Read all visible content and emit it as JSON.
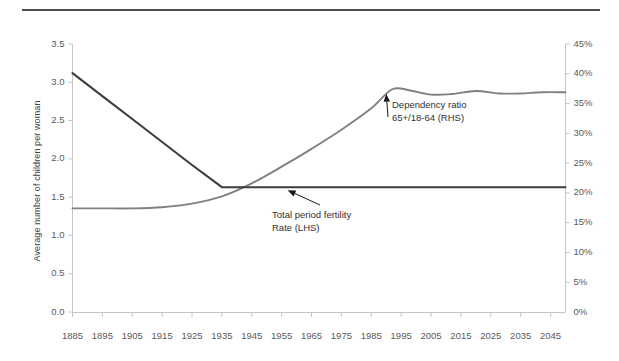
{
  "chart_data": {
    "type": "line",
    "title": "",
    "subtitle": "",
    "xlabel": "",
    "ylabel": "Average  number of children per woman",
    "ylabel_right": "",
    "xlim": [
      1885,
      2050
    ],
    "ylim": [
      0.0,
      3.5
    ],
    "ylim_right": [
      0,
      45
    ],
    "grid": false,
    "legend_position": "inline-annotations",
    "x_ticks": [
      1885,
      1895,
      1905,
      1915,
      1925,
      1935,
      1945,
      1955,
      1965,
      1975,
      1985,
      1995,
      2005,
      2015,
      2025,
      2035,
      2045
    ],
    "y_ticks_left": [
      "0.0",
      "0.5",
      "1.0",
      "1.5",
      "2.0",
      "2.5",
      "3.0",
      "3.5"
    ],
    "y_ticks_right": [
      "0%",
      "5%",
      "10%",
      "15%",
      "20%",
      "25%",
      "30%",
      "35%",
      "40%",
      "45%"
    ],
    "series": [
      {
        "name": "Total period fertility Rate (LHS)",
        "axis": "left",
        "color": "#3d3d3d",
        "x": [
          1885,
          1895,
          1905,
          1915,
          1925,
          1935,
          1940,
          1945,
          1955,
          1965,
          1975,
          1985,
          1995,
          2005,
          2015,
          2025,
          2035,
          2045,
          2050
        ],
        "values": [
          3.12,
          2.82,
          2.52,
          2.22,
          1.92,
          1.63,
          1.63,
          1.63,
          1.63,
          1.63,
          1.63,
          1.63,
          1.63,
          1.63,
          1.63,
          1.63,
          1.63,
          1.63,
          1.63
        ]
      },
      {
        "name": "Dependency ratio 65+/18-64 (RHS)",
        "axis": "right",
        "color": "#808080",
        "x": [
          1885,
          1895,
          1905,
          1915,
          1925,
          1935,
          1945,
          1955,
          1965,
          1975,
          1985,
          1992,
          1998,
          2005,
          2012,
          2020,
          2028,
          2035,
          2042,
          2050
        ],
        "values": [
          17.4,
          17.4,
          17.4,
          17.6,
          18.2,
          19.4,
          21.6,
          24.4,
          27.4,
          30.6,
          34.2,
          37.4,
          37.2,
          36.5,
          36.6,
          37.1,
          36.7,
          36.7,
          36.9,
          36.9
        ]
      }
    ],
    "annotations": [
      {
        "id": "annotation-dependency",
        "text_lines": [
          "Dependency ratio",
          "65+/18-64 (RHS)"
        ],
        "target_x": 1990,
        "target_y_right": 37.0
      },
      {
        "id": "annotation-fertility",
        "text_lines": [
          "Total period fertility",
          "Rate (LHS)"
        ],
        "target_x": 1957,
        "target_y_left": 1.63
      }
    ]
  },
  "axes": {
    "y_left_title": "Average  number of children per woman",
    "y_left_ticks": [
      "3.5",
      "3.0",
      "2.5",
      "2.0",
      "1.5",
      "1.0",
      "0.5",
      "0.0"
    ],
    "y_right_ticks": [
      "45%",
      "40%",
      "35%",
      "30%",
      "25%",
      "20%",
      "15%",
      "10%",
      "5%",
      "0%"
    ],
    "x_ticks": [
      "1885",
      "1895",
      "1905",
      "1915",
      "1925",
      "1935",
      "1945",
      "1955",
      "1965",
      "1975",
      "1985",
      "1995",
      "2005",
      "2015",
      "2025",
      "2035",
      "2045"
    ]
  },
  "annotations": {
    "dependency": {
      "line1": "Dependency ratio",
      "line2": "65+/18-64 (RHS)"
    },
    "fertility": {
      "line1": "Total period fertility",
      "line2": "Rate (LHS)"
    }
  },
  "colors": {
    "fertility_line": "#3d3d3d",
    "dependency_line": "#808080",
    "axis": "#bdbdbd",
    "top_rule": "#4d4d4d",
    "tick_text": "#5a5a5a"
  }
}
